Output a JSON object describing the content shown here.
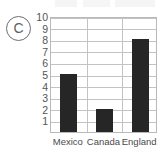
{
  "marker": {
    "label": "C"
  },
  "chart_data": {
    "type": "bar",
    "title": "",
    "xlabel": "",
    "ylabel": "",
    "categories": [
      "Mexico",
      "Canada",
      "England"
    ],
    "values": [
      5,
      2,
      8
    ],
    "ylim": [
      0,
      10
    ],
    "ytick_labels": [
      "10",
      "9",
      "8",
      "7",
      "6",
      "5",
      "4",
      "3",
      "2",
      "1"
    ],
    "ytick_values": [
      10,
      9,
      8,
      7,
      6,
      5,
      4,
      3,
      2,
      1
    ],
    "grid": true,
    "legend": "none",
    "bar_color": "#262626",
    "grid_color": "#c3c3c3",
    "frame_color": "#b9b9b9"
  }
}
